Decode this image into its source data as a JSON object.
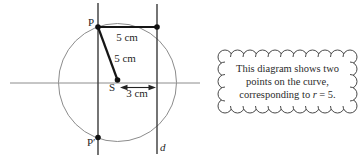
{
  "figure": {
    "labels": {
      "point_p": "P",
      "point_p_prime": "P′",
      "focus_s": "S",
      "directrix_d": "d",
      "dist_p_to_directrix": "5 cm",
      "dist_p_to_focus": "5 cm",
      "dist_focus_to_directrix": "3 cm"
    },
    "colors": {
      "thin_line": "#8c8c8c",
      "main_line": "#3a3a3a",
      "bold_line": "#161616",
      "dot": "#111111",
      "cloud_border": "#4a4a4a",
      "text": "#1f1f1f"
    }
  },
  "callout": {
    "line1": "This diagram shows two",
    "line2": "points on the curve,",
    "line3_prefix": "corresponding to",
    "line3_var": "r",
    "line3_suffix": "= 5."
  }
}
